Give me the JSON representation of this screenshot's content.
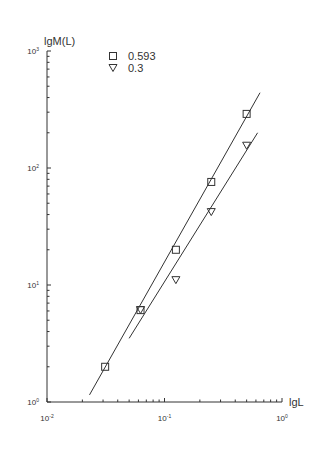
{
  "chart_data": {
    "type": "scatter",
    "title": "",
    "xlabel": "lgL",
    "ylabel": "lgM(L)",
    "xscale": "log",
    "yscale": "log",
    "xlim": [
      0.01,
      1
    ],
    "ylim": [
      1,
      1000
    ],
    "x_ticks": [
      "10^-2",
      "10^-1",
      "10^0"
    ],
    "y_ticks": [
      "10^0",
      "10^1",
      "10^2",
      "10^3"
    ],
    "grid": false,
    "legend_position": "top-left inside",
    "series": [
      {
        "name": "0.593",
        "marker": "square",
        "x": [
          0.03125,
          0.0625,
          0.125,
          0.25,
          0.5
        ],
        "y": [
          2.0,
          6.1,
          20,
          76,
          290
        ],
        "fit_line": {
          "x": [
            0.023,
            0.65
          ],
          "y": [
            1.15,
            440
          ]
        }
      },
      {
        "name": "0.3",
        "marker": "triangle-down",
        "x": [
          0.0625,
          0.125,
          0.25,
          0.5
        ],
        "y": [
          6.1,
          11,
          42,
          155
        ],
        "fit_line": {
          "x": [
            0.05,
            0.62
          ],
          "y": [
            3.5,
            200
          ]
        }
      }
    ]
  },
  "labels": {
    "xlabel": "lgL",
    "ylabel": "lgM(L)",
    "legend": [
      "0.593",
      "0.3"
    ]
  }
}
